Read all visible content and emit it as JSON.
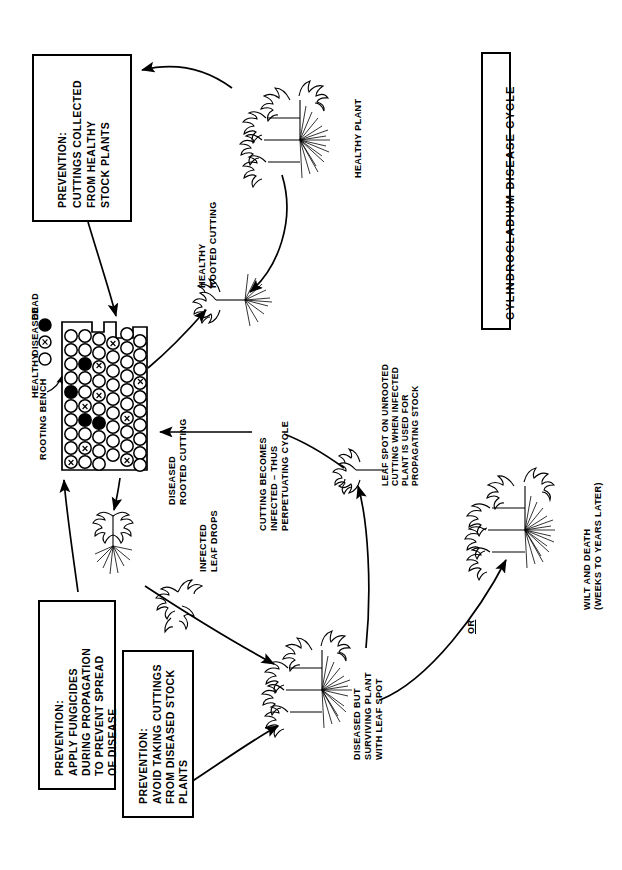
{
  "title": "CYLINDROCLADIUM DISEASE CYCLE",
  "legend": {
    "items": [
      {
        "symbol": "dead-marker",
        "label": "DEAD"
      },
      {
        "symbol": "diseased-marker",
        "label": "DISEASED"
      },
      {
        "symbol": "healthy-marker",
        "label": "HEALTHY"
      }
    ]
  },
  "bench_label": "ROOTING BENCH",
  "prevention_boxes": [
    {
      "id": "prevention-healthy-stock",
      "heading": "PREVENTION:",
      "lines": [
        "CUTTINGS COLLECTED",
        "FROM HEALTHY",
        "STOCK PLANTS"
      ]
    },
    {
      "id": "prevention-fungicides",
      "heading": "PREVENTION:",
      "lines": [
        "APPLY FUNGICIDES",
        "DURING PROPAGATION",
        "TO PREVENT SPREAD",
        "OF DISEASE"
      ]
    },
    {
      "id": "prevention-avoid-diseased",
      "heading": "PREVENTION:",
      "lines": [
        "AVOID TAKING CUTTINGS",
        "FROM DISEASED STOCK",
        "PLANTS"
      ]
    }
  ],
  "stage_labels": {
    "healthy_plant": "HEALTHY PLANT",
    "healthy_rooted_cutting": [
      "HEALTHY",
      "ROOTED CUTTING"
    ],
    "diseased_rooted_cutting": [
      "DISEASED",
      "ROOTED CUTTING"
    ],
    "infected_leaf_drops": [
      "INFECTED",
      "LEAF DROPS"
    ],
    "cutting_becomes_infected": [
      "CUTTING BECOMES",
      "INFECTED – THUS",
      "PERPETUATING CYCLE"
    ],
    "leaf_spot_unrooted": [
      "LEAF SPOT ON UNROOTED",
      "CUTTING WHEN INFECTED",
      "PLANT IS USED FOR",
      "PROPAGATING STOCK"
    ],
    "diseased_surviving": [
      "DISEASED BUT",
      "SURVIVING PLANT",
      "WITH LEAF SPOT"
    ],
    "wilt_and_death": [
      "WILT AND DEATH",
      "(WEEKS TO YEARS LATER)"
    ],
    "or_branch": "OR"
  },
  "colors": {
    "ink": "#000000",
    "paper": "#ffffff"
  }
}
